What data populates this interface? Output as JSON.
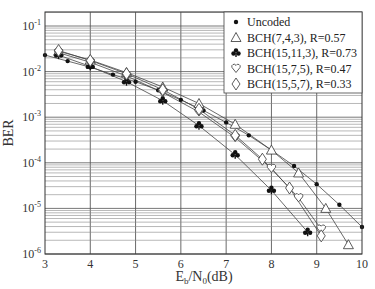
{
  "chart_data": {
    "type": "line",
    "title": "",
    "xlabel": "Eb/N0(dB)",
    "xlabel_main": "E",
    "xlabel_sub": "b",
    "xlabel_mid": "/N",
    "xlabel_sub2": "0",
    "xlabel_tail": "(dB)",
    "ylabel": "BER",
    "xlim": [
      3,
      10
    ],
    "ylim": [
      1e-06,
      0.2
    ],
    "yscale": "log",
    "grid": true,
    "legend_position": "upper right",
    "x_ticks": [
      "3",
      "4",
      "5",
      "6",
      "7",
      "8",
      "9",
      "10"
    ],
    "y_ticks": [
      {
        "base": "10",
        "exp": "-1",
        "value": 0.1
      },
      {
        "base": "10",
        "exp": "-2",
        "value": 0.01
      },
      {
        "base": "10",
        "exp": "-3",
        "value": 0.001
      },
      {
        "base": "10",
        "exp": "-4",
        "value": 0.0001
      },
      {
        "base": "10",
        "exp": "-5",
        "value": 1e-05
      },
      {
        "base": "10",
        "exp": "-6",
        "value": 1e-06
      }
    ],
    "series": [
      {
        "name": "Uncoded",
        "marker": "dot",
        "x": [
          3,
          3.5,
          4,
          4.5,
          5,
          5.5,
          6,
          6.5,
          7,
          7.5,
          8,
          8.5,
          9,
          9.5,
          10
        ],
        "y": [
          0.023,
          0.017,
          0.0125,
          0.0086,
          0.006,
          0.0039,
          0.0024,
          0.0014,
          0.00077,
          0.0004,
          0.00019,
          8.5e-05,
          3.4e-05,
          1.2e-05,
          3.9e-06
        ]
      },
      {
        "name": "BCH(7,4,3), R=0.57",
        "marker": "triangle",
        "x": [
          3.3,
          4,
          4.8,
          5.6,
          6.4,
          7.2,
          8,
          8.6,
          9.2,
          9.7
        ],
        "y": [
          0.028,
          0.018,
          0.0095,
          0.0046,
          0.002,
          0.0007,
          0.00019,
          6e-05,
          1e-05,
          1.6e-06
        ]
      },
      {
        "name": "BCH(15,11,3), R=0.73",
        "marker": "club",
        "x": [
          3.3,
          4,
          4.8,
          5.6,
          6.4,
          7.2,
          8,
          8.8
        ],
        "y": [
          0.023,
          0.013,
          0.006,
          0.0023,
          0.00065,
          0.00015,
          2.5e-05,
          3e-06
        ]
      },
      {
        "name": "BCH(15,7,5), R=0.47",
        "marker": "heart",
        "x": [
          3.3,
          4,
          4.8,
          5.6,
          6.4,
          7.2,
          8,
          8.6,
          9.1
        ],
        "y": [
          0.026,
          0.016,
          0.008,
          0.0035,
          0.0013,
          0.00036,
          7.5e-05,
          1.7e-05,
          3.5e-06
        ]
      },
      {
        "name": "BCH(15,5,7), R=0.33",
        "marker": "diamond",
        "x": [
          3.3,
          4,
          4.8,
          5.6,
          6.4,
          7.2,
          7.8,
          8.4,
          9.1
        ],
        "y": [
          0.029,
          0.0175,
          0.009,
          0.004,
          0.0015,
          0.0004,
          0.00012,
          2.8e-05,
          2.5e-06
        ]
      }
    ]
  },
  "legend": {
    "items": [
      {
        "label": "Uncoded",
        "marker": "dot"
      },
      {
        "label": "BCH(7,4,3), R=0.57",
        "marker": "triangle"
      },
      {
        "label": "BCH(15,11,3), R=0.73",
        "marker": "club"
      },
      {
        "label": "BCH(15,7,5), R=0.47",
        "marker": "heart"
      },
      {
        "label": "BCH(15,5,7), R=0.33",
        "marker": "diamond"
      }
    ]
  }
}
